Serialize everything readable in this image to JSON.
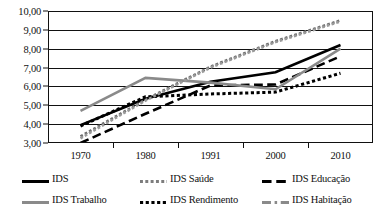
{
  "chart_data": {
    "type": "line",
    "title": "",
    "xlabel": "",
    "ylabel": "",
    "x": [
      "1970",
      "1980",
      "1991",
      "2000",
      "2010"
    ],
    "categories": [
      "1970",
      "1980",
      "1991",
      "2000",
      "2010"
    ],
    "ylim": [
      3.0,
      10.0
    ],
    "ytick_labels": [
      "3,00",
      "4,00",
      "5,00",
      "6,00",
      "7,00",
      "8,00",
      "9,00",
      "10,00"
    ],
    "ytick_values": [
      3,
      4,
      5,
      6,
      7,
      8,
      9,
      10
    ],
    "grid": true,
    "legend_position": "bottom",
    "series": [
      {
        "name": "IDS",
        "style": "solid",
        "color": "#000000",
        "width": 2.6,
        "values": [
          3.95,
          5.35,
          6.25,
          6.75,
          8.2
        ]
      },
      {
        "name": "IDS Saúde",
        "style": "dotted",
        "color": "#6e6e6e",
        "width": 2.6,
        "values": [
          3.35,
          5.3,
          7.05,
          8.4,
          9.5
        ]
      },
      {
        "name": "IDS Educação",
        "style": "dashed",
        "color": "#000000",
        "width": 2.6,
        "values": [
          3.0,
          4.55,
          6.05,
          6.1,
          7.6
        ]
      },
      {
        "name": "IDS Trabalho",
        "style": "solid",
        "color": "#8a8a8a",
        "width": 2.6,
        "values": [
          4.7,
          6.45,
          6.2,
          5.85,
          8.0
        ]
      },
      {
        "name": "IDS Rendimento",
        "style": "dotted",
        "color": "#000000",
        "width": 3.0,
        "values": [
          3.9,
          5.45,
          5.6,
          5.7,
          6.7
        ]
      },
      {
        "name": "IDS Habitação",
        "style": "dotted",
        "color": "#9a9a9a",
        "width": 2.6,
        "values": [
          3.25,
          5.25,
          7.0,
          8.35,
          9.45
        ]
      }
    ]
  },
  "legend": {
    "items": [
      {
        "label": "IDS",
        "swatch": "solid-black-thick"
      },
      {
        "label": "IDS Saúde",
        "swatch": "dotted-gray"
      },
      {
        "label": "IDS Educação",
        "swatch": "dashed-black"
      },
      {
        "label": "IDS Trabalho",
        "swatch": "solid-gray"
      },
      {
        "label": "IDS Rendimento",
        "swatch": "dotted-black"
      },
      {
        "label": "IDS Habitação",
        "swatch": "dashdot-gray"
      }
    ]
  }
}
